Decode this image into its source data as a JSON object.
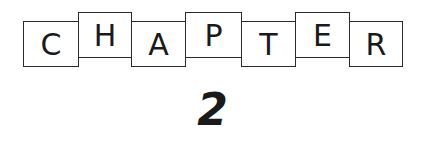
{
  "heading": {
    "letters": [
      "C",
      "H",
      "A",
      "P",
      "T",
      "E",
      "R"
    ],
    "word": "CHAPTER"
  },
  "chapter_number": "2"
}
